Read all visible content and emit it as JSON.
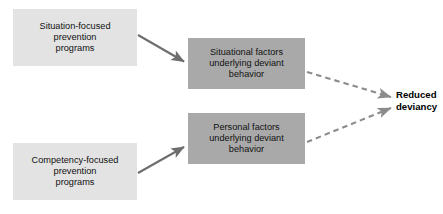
{
  "diagram": {
    "colors": {
      "light_box_fill": "#e3e3e3",
      "shaded_box_fill": "#a9a9a9",
      "solid_arrow": "#6e6e6e",
      "dashed_arrow": "#8c8c8c",
      "text": "#111111",
      "background": "#ffffff"
    },
    "nodes": {
      "situation_programs": {
        "label": "Situation-focused\nprevention\nprograms",
        "style": "light"
      },
      "competency_programs": {
        "label": "Competency-focused\nprevention\nprograms",
        "style": "light"
      },
      "situational_factors": {
        "label": "Situational factors\nunderlying deviant\nbehavior",
        "style": "shaded"
      },
      "personal_factors": {
        "label": "Personal factors\nunderlying deviant\nbehavior",
        "style": "shaded"
      },
      "reduced_deviancy": {
        "label": "Reduced\ndeviancy",
        "style": "bold-text"
      }
    },
    "edges": [
      {
        "name": "situation-programs-to-situational-factors",
        "from": "situation_programs",
        "to": "situational_factors",
        "style": "solid"
      },
      {
        "name": "competency-programs-to-personal-factors",
        "from": "competency_programs",
        "to": "personal_factors",
        "style": "solid"
      },
      {
        "name": "situational-factors-to-reduced-deviancy",
        "from": "situational_factors",
        "to": "reduced_deviancy",
        "style": "dashed"
      },
      {
        "name": "personal-factors-to-reduced-deviancy",
        "from": "personal_factors",
        "to": "reduced_deviancy",
        "style": "dashed"
      }
    ]
  }
}
